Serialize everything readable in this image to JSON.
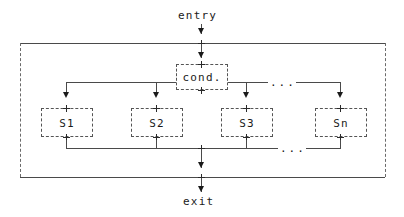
{
  "diagram": {
    "type": "control-flow-graph",
    "style": "ascii-art",
    "title_text": "",
    "entry_label": "entry",
    "exit_label": "exit",
    "condition_label": "cond.",
    "ellipsis": "...",
    "branches": [
      {
        "label": "S1"
      },
      {
        "label": "S2"
      },
      {
        "label": "S3"
      },
      {
        "label": "Sn"
      }
    ],
    "colors": {
      "background": "#ffffff",
      "text": "#1a1a1a",
      "solid_line": "#4a4a4a",
      "dashed_line": "#6a6a6a",
      "box_border": "#555555"
    }
  }
}
